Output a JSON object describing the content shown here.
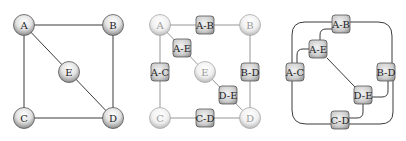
{
  "panels": [
    {
      "id": "original-graph",
      "nodes": [
        {
          "id": "A",
          "label": "A",
          "x": 24,
          "y": 25
        },
        {
          "id": "B",
          "label": "B",
          "x": 113,
          "y": 25
        },
        {
          "id": "E",
          "label": "E",
          "x": 69,
          "y": 72
        },
        {
          "id": "C",
          "label": "C",
          "x": 24,
          "y": 118
        },
        {
          "id": "D",
          "label": "D",
          "x": 113,
          "y": 118
        }
      ],
      "edges": [
        [
          "A",
          "B"
        ],
        [
          "A",
          "C"
        ],
        [
          "A",
          "E"
        ],
        [
          "B",
          "D"
        ],
        [
          "C",
          "D"
        ],
        [
          "E",
          "D"
        ]
      ]
    },
    {
      "id": "subdivided-graph",
      "nodes": [
        {
          "id": "A",
          "label": "A",
          "x": 160,
          "y": 25
        },
        {
          "id": "B",
          "label": "B",
          "x": 250,
          "y": 25
        },
        {
          "id": "E",
          "label": "E",
          "x": 205,
          "y": 72
        },
        {
          "id": "C",
          "label": "C",
          "x": 160,
          "y": 118
        },
        {
          "id": "D",
          "label": "D",
          "x": 250,
          "y": 118
        }
      ],
      "edge_nodes": [
        {
          "id": "A-B",
          "label": "A-B",
          "x": 205,
          "y": 25
        },
        {
          "id": "A-E",
          "label": "A-E",
          "x": 182,
          "y": 48
        },
        {
          "id": "A-C",
          "label": "A-C",
          "x": 160,
          "y": 72
        },
        {
          "id": "B-D",
          "label": "B-D",
          "x": 250,
          "y": 72
        },
        {
          "id": "D-E",
          "label": "D-E",
          "x": 228,
          "y": 95
        },
        {
          "id": "C-D",
          "label": "C-D",
          "x": 205,
          "y": 118
        }
      ]
    },
    {
      "id": "line-graph",
      "edge_nodes": [
        {
          "id": "A-B",
          "label": "A-B",
          "x": 341,
          "y": 24
        },
        {
          "id": "A-E",
          "label": "A-E",
          "x": 318,
          "y": 49
        },
        {
          "id": "A-C",
          "label": "A-C",
          "x": 295,
          "y": 72
        },
        {
          "id": "B-D",
          "label": "B-D",
          "x": 386,
          "y": 72
        },
        {
          "id": "D-E",
          "label": "D-E",
          "x": 363,
          "y": 95
        },
        {
          "id": "C-D",
          "label": "C-D",
          "x": 340,
          "y": 120
        }
      ]
    }
  ],
  "colors": {
    "edge": "#3a3a3a",
    "edge_light": "#8a8a8a",
    "node_fill_light": "#f4f4f4",
    "node_fill_dark": "#9a9a9a",
    "box_fill_light": "#e6e6e6",
    "box_fill_dark": "#8c8c8c",
    "text": "#222222",
    "text_faded": "#9a9a9a"
  }
}
